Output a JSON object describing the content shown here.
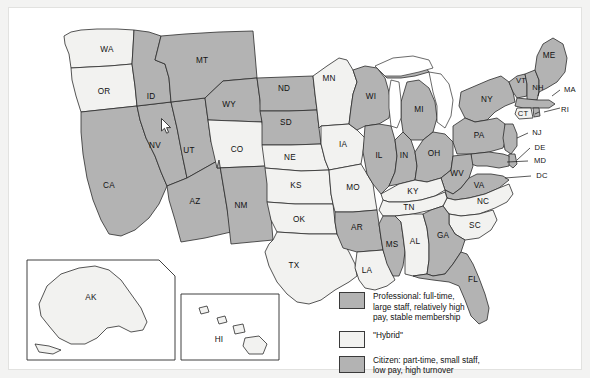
{
  "figure": {
    "type": "choropleth-map"
  },
  "legend": {
    "items": [
      {
        "key": "professional",
        "swatch_color": "#b3b3b3",
        "label": "Professional: full-time, large staff, relatively high pay, stable membership",
        "lines": [
          "Professional: full-time,",
          "large staff, relatively high",
          "pay, stable membership"
        ]
      },
      {
        "key": "hybrid",
        "swatch_color": "#f4f4f2",
        "label": "\"Hybrid\"",
        "lines": [
          "\"Hybrid\""
        ]
      },
      {
        "key": "citizen",
        "swatch_color": "#b3b3b3",
        "label": "Citizen: part-time, small staff, low pay, high turnover",
        "lines": [
          "Citizen: part-time, small staff,",
          "low pay, high turnover"
        ]
      }
    ]
  },
  "map": {
    "states": [
      {
        "code": "WA",
        "category": "hybrid"
      },
      {
        "code": "OR",
        "category": "hybrid"
      },
      {
        "code": "ID",
        "category": "citizen"
      },
      {
        "code": "MT",
        "category": "citizen"
      },
      {
        "code": "WY",
        "category": "citizen"
      },
      {
        "code": "ND",
        "category": "citizen"
      },
      {
        "code": "SD",
        "category": "citizen"
      },
      {
        "code": "MN",
        "category": "hybrid"
      },
      {
        "code": "WI",
        "category": "citizen"
      },
      {
        "code": "MI",
        "category": "professional"
      },
      {
        "code": "ME",
        "category": "citizen"
      },
      {
        "code": "VT",
        "category": "citizen"
      },
      {
        "code": "NH",
        "category": "citizen"
      },
      {
        "code": "MA",
        "category": "professional"
      },
      {
        "code": "NY",
        "category": "professional"
      },
      {
        "code": "CT",
        "category": "hybrid"
      },
      {
        "code": "RI",
        "category": "citizen"
      },
      {
        "code": "PA",
        "category": "professional"
      },
      {
        "code": "NJ",
        "category": "professional"
      },
      {
        "code": "DE",
        "category": "citizen"
      },
      {
        "code": "MD",
        "category": "citizen"
      },
      {
        "code": "DC",
        "category": "citizen"
      },
      {
        "code": "OH",
        "category": "professional"
      },
      {
        "code": "IN",
        "category": "citizen"
      },
      {
        "code": "IL",
        "category": "professional"
      },
      {
        "code": "IA",
        "category": "hybrid"
      },
      {
        "code": "NE",
        "category": "hybrid"
      },
      {
        "code": "KS",
        "category": "hybrid"
      },
      {
        "code": "MO",
        "category": "hybrid"
      },
      {
        "code": "CO",
        "category": "hybrid"
      },
      {
        "code": "UT",
        "category": "citizen"
      },
      {
        "code": "NV",
        "category": "citizen"
      },
      {
        "code": "CA",
        "category": "professional"
      },
      {
        "code": "AZ",
        "category": "citizen"
      },
      {
        "code": "NM",
        "category": "citizen"
      },
      {
        "code": "OK",
        "category": "hybrid"
      },
      {
        "code": "TX",
        "category": "hybrid"
      },
      {
        "code": "AR",
        "category": "citizen"
      },
      {
        "code": "LA",
        "category": "hybrid"
      },
      {
        "code": "MS",
        "category": "citizen"
      },
      {
        "code": "AL",
        "category": "hybrid"
      },
      {
        "code": "GA",
        "category": "citizen"
      },
      {
        "code": "FL",
        "category": "professional"
      },
      {
        "code": "TN",
        "category": "hybrid"
      },
      {
        "code": "KY",
        "category": "hybrid"
      },
      {
        "code": "WV",
        "category": "citizen"
      },
      {
        "code": "VA",
        "category": "citizen"
      },
      {
        "code": "NC",
        "category": "hybrid"
      },
      {
        "code": "SC",
        "category": "hybrid"
      },
      {
        "code": "AK",
        "category": "hybrid"
      },
      {
        "code": "HI",
        "category": "hybrid"
      }
    ],
    "inset_labels": [
      "AK",
      "HI"
    ]
  },
  "colors": {
    "professional": "#b3b3b3",
    "hybrid": "#f2f2f0",
    "citizen": "#b3b3b3",
    "outline": "#2b2b2b",
    "page_background": "#f3f3f2",
    "panel_background": "#ffffff"
  },
  "cursor": {
    "icon": "arrow-pointer",
    "x": 163,
    "y": 126
  }
}
